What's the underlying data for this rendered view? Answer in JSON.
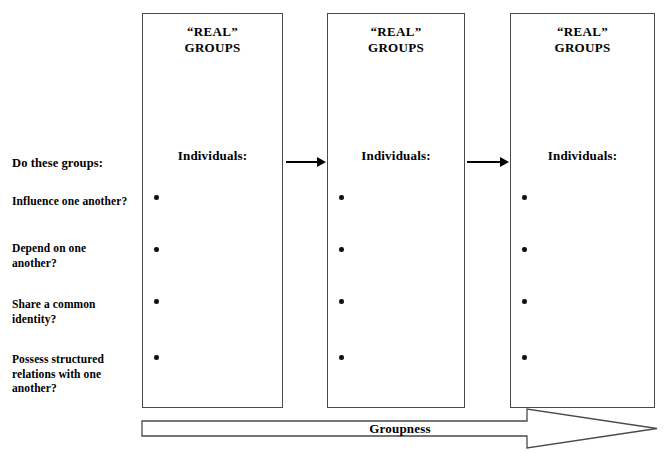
{
  "diagram": {
    "background_color": "#ffffff",
    "line_color": "#4a4a4a",
    "text_color": "#000000"
  },
  "questions": {
    "lead": "Do these groups:",
    "items": [
      "Influence one another?",
      "Depend on one\nanother?",
      "Share a common\nidentity?",
      "Possess structured\nrelations with one\nanother?"
    ]
  },
  "groups": [
    {
      "title": "“REAL”\nGROUPS",
      "subtitle": "Individuals:",
      "bullet_count": 4
    },
    {
      "title": "“REAL”\nGROUPS",
      "subtitle": "Individuals:",
      "bullet_count": 4
    },
    {
      "title": "“REAL”\nGROUPS",
      "subtitle": "Individuals:",
      "bullet_count": 4
    }
  ],
  "connectors": [
    {
      "name": "arrow-group1-to-group2",
      "direction": "right"
    },
    {
      "name": "arrow-group2-to-group3",
      "direction": "right"
    }
  ],
  "groupness": {
    "label": "Groupness",
    "direction": "right"
  }
}
